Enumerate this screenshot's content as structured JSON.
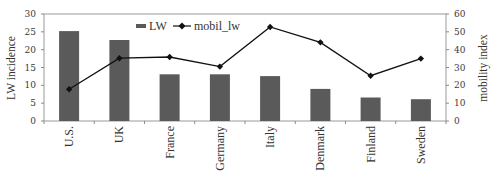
{
  "chart_data": {
    "type": "bar+line",
    "title": "",
    "categories": [
      "U.S.",
      "UK",
      "France",
      "Germany",
      "Italy",
      "Denmark",
      "Finland",
      "Sweden"
    ],
    "series": [
      {
        "name": "LW",
        "type": "bar",
        "axis": "left",
        "color": "#5a5a5a",
        "values": [
          25.2,
          22.7,
          13.1,
          13.1,
          12.6,
          9.0,
          6.6,
          6.1
        ]
      },
      {
        "name": "mobil_lw",
        "type": "line",
        "axis": "right",
        "color": "#111111",
        "marker": "diamond",
        "values": [
          17.8,
          35.2,
          35.9,
          30.5,
          52.7,
          44.1,
          25.4,
          35.0
        ]
      }
    ],
    "ylabel": "LW incidence",
    "ylabel_right": "mobility index",
    "xlabel": "",
    "ylim": [
      0,
      30
    ],
    "ylim_right": [
      0,
      60
    ],
    "yticks": [
      0,
      5,
      10,
      15,
      20,
      25,
      30
    ],
    "yticks_right": [
      0,
      10,
      20,
      30,
      40,
      50,
      60
    ],
    "grid": false,
    "legend_position": "top-inside-left"
  },
  "legend": {
    "items": [
      {
        "label": "LW",
        "kind": "bar-swatch"
      },
      {
        "label": "mobil_lw",
        "kind": "line-diamond"
      }
    ]
  },
  "axes": {
    "left_title": "LW incidence",
    "right_title": "mobility index"
  }
}
